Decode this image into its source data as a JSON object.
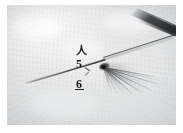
{
  "figure": {
    "kind": "macro-photograph",
    "colors": {
      "background_paper": "#ffffff",
      "substrate_light": "#efefef",
      "substrate_mid": "#e4e5e6",
      "substrate_shadow": "#dcdddf",
      "ink_dark": "#17191c",
      "instrument_dark": "#16181b",
      "fibre_gray": "#5f6164"
    },
    "annotations": [
      {
        "id": "glyph",
        "text": "人",
        "name": "annotation-glyph-person"
      },
      {
        "id": "five",
        "text": "5",
        "name": "annotation-number-five"
      },
      {
        "id": "six",
        "text": "6",
        "name": "annotation-number-six"
      }
    ]
  },
  "elements": {
    "needle_label": "needle shaft",
    "filament_label": "filament",
    "instrument_label": "instrument tip",
    "fibre_label": "fibre bundle",
    "knot_label": "junction knot",
    "substrate_label": "substrate surface"
  }
}
